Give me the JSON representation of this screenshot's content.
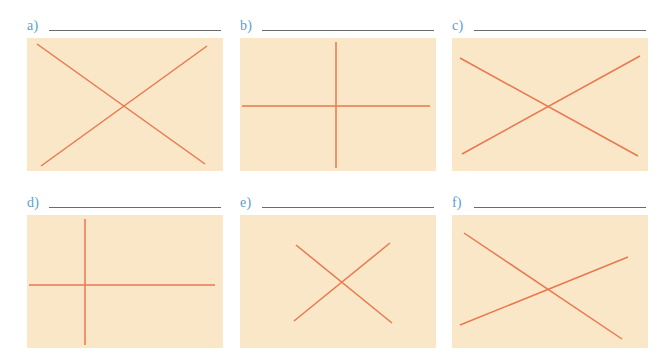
{
  "worksheet": {
    "background_color": "#ffffff",
    "figure_background_color": "#fae7c8",
    "line_color": "#e8794f",
    "label_color": "#5b9ec9",
    "rule_color": "#6b6b6b"
  },
  "panels": [
    {
      "id": "a",
      "label": "a)",
      "answer_text": "",
      "figure": {
        "width": 196,
        "height": 133,
        "lines": [
          {
            "name": "line-1",
            "x1": 10,
            "y1": 6,
            "x2": 178,
            "y2": 126
          },
          {
            "name": "line-2",
            "x1": 180,
            "y1": 8,
            "x2": 14,
            "y2": 128
          }
        ]
      }
    },
    {
      "id": "b",
      "label": "b)",
      "answer_text": "",
      "figure": {
        "width": 196,
        "height": 133,
        "lines": [
          {
            "name": "line-1",
            "x1": 96,
            "y1": 4,
            "x2": 96,
            "y2": 130
          },
          {
            "name": "line-2",
            "x1": 2,
            "y1": 68,
            "x2": 190,
            "y2": 68
          }
        ]
      }
    },
    {
      "id": "c",
      "label": "c)",
      "answer_text": "",
      "figure": {
        "width": 196,
        "height": 133,
        "lines": [
          {
            "name": "line-1",
            "x1": 8,
            "y1": 20,
            "x2": 186,
            "y2": 118
          },
          {
            "name": "line-2",
            "x1": 188,
            "y1": 18,
            "x2": 10,
            "y2": 116
          }
        ]
      }
    },
    {
      "id": "d",
      "label": "d)",
      "answer_text": "",
      "figure": {
        "width": 196,
        "height": 133,
        "lines": [
          {
            "name": "line-1",
            "x1": 58,
            "y1": 4,
            "x2": 58,
            "y2": 130
          },
          {
            "name": "line-2",
            "x1": 2,
            "y1": 70,
            "x2": 188,
            "y2": 70
          }
        ]
      }
    },
    {
      "id": "e",
      "label": "e)",
      "answer_text": "",
      "figure": {
        "width": 196,
        "height": 133,
        "lines": [
          {
            "name": "line-1",
            "x1": 56,
            "y1": 30,
            "x2": 152,
            "y2": 108
          },
          {
            "name": "line-2",
            "x1": 150,
            "y1": 28,
            "x2": 54,
            "y2": 106
          }
        ]
      }
    },
    {
      "id": "f",
      "label": "f)",
      "answer_text": "",
      "figure": {
        "width": 196,
        "height": 133,
        "lines": [
          {
            "name": "line-1",
            "x1": 12,
            "y1": 18,
            "x2": 170,
            "y2": 124
          },
          {
            "name": "line-2",
            "x1": 8,
            "y1": 110,
            "x2": 176,
            "y2": 42
          }
        ]
      }
    }
  ],
  "layout": {
    "columns": 3,
    "rows": 2,
    "panel_positions": [
      {
        "id": "a",
        "left": 27,
        "top": 18
      },
      {
        "id": "b",
        "left": 240,
        "top": 18
      },
      {
        "id": "c",
        "left": 452,
        "top": 18
      },
      {
        "id": "d",
        "left": 27,
        "top": 195
      },
      {
        "id": "e",
        "left": 240,
        "top": 195
      },
      {
        "id": "f",
        "left": 452,
        "top": 195
      }
    ]
  }
}
